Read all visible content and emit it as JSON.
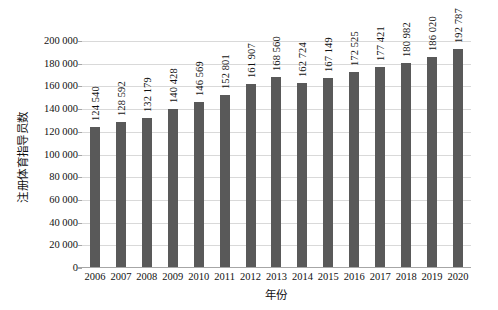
{
  "chart_data": {
    "type": "bar",
    "title": "",
    "xlabel": "年份",
    "ylabel": "注册体育指导员数",
    "categories": [
      "2006",
      "2007",
      "2008",
      "2009",
      "2010",
      "2011",
      "2012",
      "2013",
      "2014",
      "2015",
      "2016",
      "2017",
      "2018",
      "2019",
      "2020"
    ],
    "values": [
      124540,
      128592,
      132179,
      140428,
      146569,
      152801,
      161907,
      168560,
      162724,
      167149,
      172525,
      177421,
      180982,
      186020,
      192787
    ],
    "value_labels": [
      "124 540",
      "128 592",
      "132 179",
      "140 428",
      "146 569",
      "152 801",
      "161 907",
      "168 560",
      "162 724",
      "167 149",
      "172 525",
      "177 421",
      "180 982",
      "186 020",
      "192 787"
    ],
    "ylim": [
      0,
      200000
    ],
    "ytick_values": [
      0,
      20000,
      40000,
      60000,
      80000,
      100000,
      120000,
      140000,
      160000,
      180000,
      200000
    ],
    "ytick_labels": [
      "0",
      "20 000",
      "40 000",
      "60 000",
      "80 000",
      "100 000",
      "120 000",
      "140 000",
      "160 000",
      "180 000",
      "200 000"
    ],
    "grid": true,
    "legend": false,
    "legend_position": "none",
    "series_color": "#595959",
    "gridline_color": "#D9D9D9",
    "axis_color": "#A6A6A6",
    "background_color": "#FFFFFF",
    "data_labels_rotation": -90
  }
}
